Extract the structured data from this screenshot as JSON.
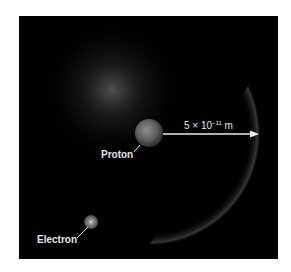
{
  "figure": {
    "background": "#000000",
    "labels": {
      "proton": "Proton",
      "electron": "Electron",
      "distance_base": "5 × 10",
      "distance_exp": "−11",
      "distance_unit": " m"
    },
    "colors": {
      "text": "#e6e6e6",
      "arrow": "#e8e8e8",
      "proton": "#8a8a8a",
      "electron": "#9a9a9a"
    }
  }
}
